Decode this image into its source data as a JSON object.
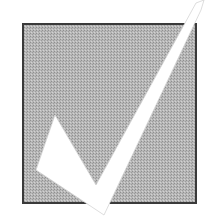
{
  "illustration": {
    "subject": "checkmark in box",
    "icon": "checkmark-icon",
    "colors": {
      "background": "#ffffff",
      "box_fill": "#b3b3b3",
      "box_fill_dark": "#9a9a9a",
      "box_border": "#3a3a3a",
      "check_fill": "#ffffff",
      "check_outline": "#d0d0d0"
    }
  }
}
